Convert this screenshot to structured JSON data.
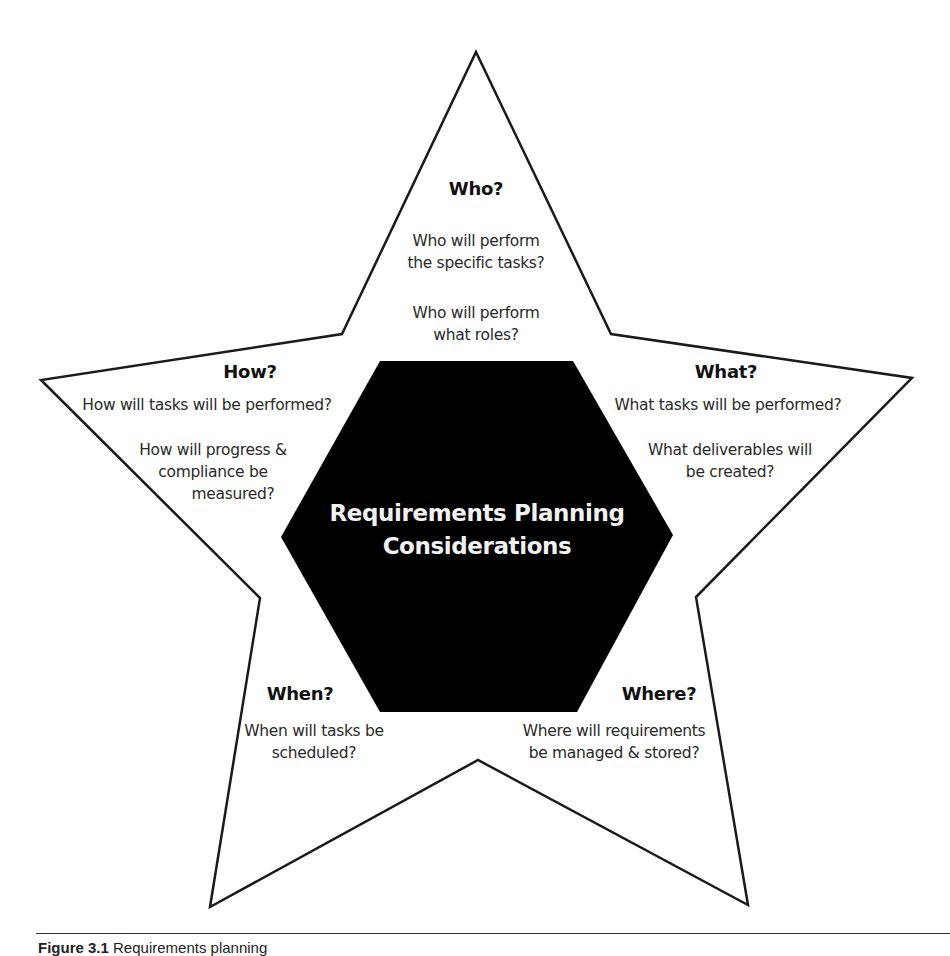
{
  "diagram": {
    "type": "star-with-hexagon",
    "center": {
      "line1": "Requirements Planning",
      "line2": "Considerations",
      "fill": "#000000",
      "text_color": "#f2f2f2"
    },
    "points": [
      {
        "id": "who",
        "heading": "Who?",
        "lines": [
          "Who will perform",
          "the specific tasks?",
          "Who will perform",
          "what roles?"
        ]
      },
      {
        "id": "what",
        "heading": "What?",
        "lines": [
          "What tasks will be performed?",
          "What deliverables will",
          "be created?"
        ]
      },
      {
        "id": "where",
        "heading": "Where?",
        "lines": [
          "Where will requirements",
          "be managed & stored?"
        ]
      },
      {
        "id": "when",
        "heading": "When?",
        "lines": [
          "When will tasks be",
          "scheduled?"
        ]
      },
      {
        "id": "how",
        "heading": "How?",
        "lines": [
          "How will tasks will be performed?",
          "How will progress &",
          "compliance be",
          "measured?"
        ]
      }
    ],
    "colors": {
      "star_stroke": "#1a1a1a",
      "star_fill": "#ffffff",
      "text": "#2a2a2a"
    }
  },
  "caption": {
    "figure_label": "Figure 3.1",
    "text": "Requirements planning"
  }
}
